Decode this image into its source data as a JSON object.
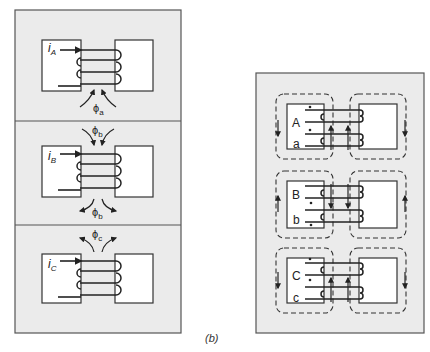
{
  "figure": {
    "caption": "(b)",
    "left_panel": {
      "sections": [
        {
          "id": "A",
          "current_label": "i",
          "current_sub": "A",
          "flux_label": "ϕ",
          "flux_sub": "a",
          "flux_direction": "up-into-gap"
        },
        {
          "id": "B",
          "current_label": "i",
          "current_sub": "B",
          "flux_label": "ϕ",
          "flux_sub": "b",
          "flux_direction": "down-into-gap-and-out"
        },
        {
          "id": "C",
          "current_label": "i",
          "current_sub": "C",
          "flux_label": "ϕ",
          "flux_sub": "c",
          "flux_direction": "up-out-of-gap"
        }
      ]
    },
    "right_panel": {
      "sections": [
        {
          "primary": "A",
          "secondary": "a"
        },
        {
          "primary": "B",
          "secondary": "b"
        },
        {
          "primary": "C",
          "secondary": "c"
        }
      ]
    },
    "colors": {
      "panel_fill": "#ebebeb",
      "core_fill": "#ffffff",
      "stroke": "#222222"
    }
  }
}
